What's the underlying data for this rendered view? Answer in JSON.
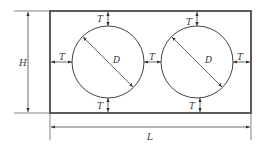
{
  "diagram": {
    "colors": {
      "outline": "#333333",
      "dimension": "#444444",
      "background": "#ffffff"
    },
    "labels": {
      "height": "H",
      "length": "L",
      "diameter": "D",
      "thickness": "T"
    },
    "shapes": {
      "rectangle": {
        "x": 50,
        "y": 11,
        "width": 201,
        "height": 102
      },
      "circles": [
        {
          "cx": 108,
          "cy": 62,
          "r": 36
        },
        {
          "cx": 197,
          "cy": 62,
          "r": 36
        }
      ]
    }
  }
}
